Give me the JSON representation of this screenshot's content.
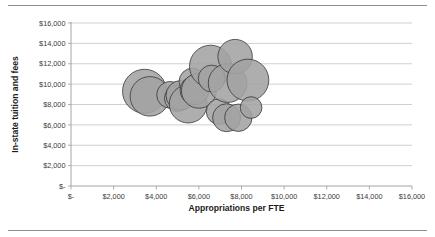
{
  "chart_data": {
    "type": "scatter",
    "subtype": "bubble",
    "title": "",
    "xlabel": "Appropriations per FTE",
    "ylabel": "In-state tuition and fees",
    "xlim": [
      0,
      16000
    ],
    "ylim": [
      0,
      16000
    ],
    "xticks": [
      0,
      2000,
      4000,
      6000,
      8000,
      10000,
      12000,
      14000,
      16000
    ],
    "yticks": [
      0,
      2000,
      4000,
      6000,
      8000,
      10000,
      12000,
      14000,
      16000
    ],
    "xtick_labels": [
      "$-",
      "$2,000",
      "$4,000",
      "$6,000",
      "$8,000",
      "$10,000",
      "$12,000",
      "$14,000",
      "$16,000"
    ],
    "ytick_labels": [
      "$-",
      "$2,000",
      "$4,000",
      "$6,000",
      "$8,000",
      "$10,000",
      "$12,000",
      "$14,000",
      "$16,000"
    ],
    "grid": "horizontal",
    "legend": "none",
    "bubble_fill": "#a3a3a3",
    "bubble_stroke": "#2f2f2f",
    "points": [
      {
        "x": 3450,
        "y": 9300,
        "size": 3100
      },
      {
        "x": 3700,
        "y": 8800,
        "size": 2500
      },
      {
        "x": 4650,
        "y": 8950,
        "size": 1150
      },
      {
        "x": 5000,
        "y": 8600,
        "size": 1100
      },
      {
        "x": 5150,
        "y": 8900,
        "size": 1400
      },
      {
        "x": 5500,
        "y": 8050,
        "size": 2300
      },
      {
        "x": 5700,
        "y": 10250,
        "size": 1150
      },
      {
        "x": 5800,
        "y": 9400,
        "size": 1350
      },
      {
        "x": 6000,
        "y": 9350,
        "size": 1950
      },
      {
        "x": 6550,
        "y": 11750,
        "size": 2850
      },
      {
        "x": 6600,
        "y": 10550,
        "size": 1150
      },
      {
        "x": 6950,
        "y": 7300,
        "size": 1050
      },
      {
        "x": 7300,
        "y": 6700,
        "size": 1250
      },
      {
        "x": 7350,
        "y": 10100,
        "size": 2400
      },
      {
        "x": 7700,
        "y": 12700,
        "size": 1900
      },
      {
        "x": 7850,
        "y": 6700,
        "size": 1200
      },
      {
        "x": 8300,
        "y": 10400,
        "size": 2800
      },
      {
        "x": 8450,
        "y": 7700,
        "size": 750
      }
    ]
  },
  "axes": {
    "x_title": "Appropriations per FTE",
    "y_title": "In-state tuition and fees"
  }
}
